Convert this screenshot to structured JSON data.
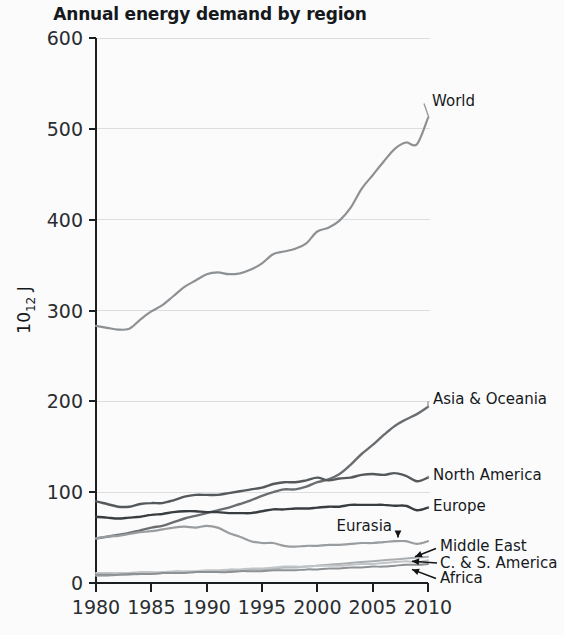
{
  "chart_data": {
    "type": "line",
    "title": "Annual energy demand by region",
    "xlabel": "",
    "ylabel": "10¹² J",
    "ylabel_base": "10",
    "ylabel_exp": "12",
    "ylabel_unit": "J",
    "xlim": [
      1980,
      2010
    ],
    "ylim": [
      0,
      600
    ],
    "grid": "horizontal",
    "legend_position": "right-inline-labels",
    "xticks": [
      1980,
      1985,
      1990,
      1995,
      2000,
      2005,
      2010
    ],
    "yticks": [
      0,
      100,
      200,
      300,
      400,
      500,
      600
    ],
    "x": [
      1980,
      1981,
      1982,
      1983,
      1984,
      1985,
      1986,
      1987,
      1988,
      1989,
      1990,
      1991,
      1992,
      1993,
      1994,
      1995,
      1996,
      1997,
      1998,
      1999,
      2000,
      2001,
      2002,
      2003,
      2004,
      2005,
      2006,
      2007,
      2008,
      2009,
      2010
    ],
    "series": [
      {
        "name": "World",
        "color": "#8e9194",
        "width": 2.2,
        "label": "World",
        "values": [
          283,
          281,
          279,
          280,
          290,
          299,
          306,
          316,
          326,
          333,
          340,
          342,
          340,
          341,
          345,
          352,
          362,
          365,
          368,
          374,
          387,
          391,
          399,
          413,
          434,
          449,
          464,
          478,
          485,
          483,
          512
        ]
      },
      {
        "name": "Asia & Oceania",
        "color": "#6b6e71",
        "width": 2.4,
        "label": "Asia & Oceania",
        "values": [
          49,
          51,
          53,
          55,
          58,
          61,
          63,
          67,
          71,
          74,
          77,
          80,
          83,
          87,
          91,
          96,
          100,
          103,
          103,
          106,
          111,
          114,
          120,
          130,
          142,
          152,
          163,
          173,
          180,
          186,
          194
        ]
      },
      {
        "name": "North America",
        "color": "#56595c",
        "width": 2.4,
        "label": "North America",
        "values": [
          90,
          87,
          84,
          84,
          87,
          88,
          88,
          91,
          95,
          97,
          97,
          97,
          99,
          101,
          103,
          105,
          109,
          111,
          111,
          113,
          116,
          113,
          115,
          116,
          119,
          120,
          119,
          121,
          118,
          112,
          116
        ]
      },
      {
        "name": "Europe",
        "color": "#3a3d40",
        "width": 2.4,
        "label": "Europe",
        "values": [
          73,
          72,
          71,
          72,
          73,
          75,
          76,
          78,
          79,
          79,
          78,
          78,
          77,
          77,
          77,
          79,
          81,
          81,
          82,
          82,
          83,
          84,
          84,
          86,
          86,
          86,
          86,
          85,
          85,
          80,
          83
        ]
      },
      {
        "name": "Eurasia",
        "color": "#9a9da0",
        "width": 2.2,
        "label": "Eurasia",
        "values": [
          49,
          51,
          52,
          54,
          56,
          57,
          59,
          61,
          62,
          61,
          63,
          61,
          55,
          51,
          46,
          44,
          44,
          41,
          40,
          41,
          41,
          42,
          42,
          43,
          44,
          44,
          45,
          46,
          46,
          43,
          46
        ]
      },
      {
        "name": "Middle East",
        "color": "#aaadb0",
        "width": 2.0,
        "label": "Middle East",
        "values": [
          8,
          8,
          9,
          9,
          10,
          10,
          11,
          11,
          12,
          12,
          13,
          13,
          14,
          14,
          15,
          15,
          16,
          17,
          17,
          18,
          19,
          20,
          21,
          22,
          23,
          24,
          25,
          26,
          27,
          28,
          29
        ]
      },
      {
        "name": "C. & S. America",
        "color": "#c2c5c8",
        "width": 2.0,
        "label": "C. & S. America",
        "values": [
          11,
          11,
          11,
          11,
          12,
          12,
          12,
          13,
          13,
          13,
          14,
          14,
          15,
          15,
          16,
          16,
          17,
          18,
          18,
          18,
          19,
          19,
          19,
          20,
          21,
          21,
          22,
          23,
          24,
          23,
          25
        ]
      },
      {
        "name": "Africa",
        "color": "#8e9194",
        "width": 2.0,
        "label": "Africa",
        "values": [
          9,
          9,
          9,
          10,
          10,
          10,
          11,
          11,
          11,
          12,
          12,
          12,
          12,
          13,
          13,
          13,
          14,
          14,
          14,
          15,
          15,
          16,
          16,
          17,
          17,
          18,
          18,
          19,
          20,
          20,
          21
        ]
      }
    ],
    "annotations": [
      {
        "text": "World",
        "kind": "leader-label"
      },
      {
        "text": "Asia & Oceania",
        "kind": "leader-label"
      },
      {
        "text": "North America",
        "kind": "leader-label"
      },
      {
        "text": "Europe",
        "kind": "leader-label"
      },
      {
        "text": "Eurasia",
        "kind": "arrow-down-label"
      },
      {
        "text": "Middle East",
        "kind": "arrow-label"
      },
      {
        "text": "C. & S. America",
        "kind": "arrow-label"
      },
      {
        "text": "Africa",
        "kind": "arrow-label"
      }
    ]
  }
}
